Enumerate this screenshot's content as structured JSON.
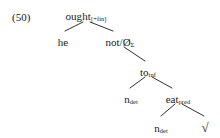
{
  "figure": {
    "example_number": "(50)",
    "background_color": "#ffffff",
    "ink_color": "#1a1a1a",
    "caption": "",
    "type": "dependency-tree"
  },
  "tree": {
    "nodes": [
      {
        "id": "ought",
        "base": "ought",
        "sub": "[+fin]",
        "x": 86,
        "y": 11,
        "role": "root"
      },
      {
        "id": "he",
        "base": "he",
        "sub": "",
        "x": 63,
        "y": 37,
        "role": "leaf"
      },
      {
        "id": "not",
        "base": "not/Ø",
        "sub": "Σ",
        "x": 120,
        "y": 37,
        "role": "branch"
      },
      {
        "id": "to",
        "base": "to",
        "sub": "inf",
        "x": 148,
        "y": 67,
        "role": "branch"
      },
      {
        "id": "n-det-upper",
        "base": "n",
        "sub": "det",
        "x": 131,
        "y": 94,
        "role": "leaf"
      },
      {
        "id": "eat",
        "base": "eat",
        "sub": "pred",
        "x": 178,
        "y": 94,
        "role": "branch"
      },
      {
        "id": "n-det-lower",
        "base": "n",
        "sub": "det",
        "x": 161,
        "y": 123,
        "role": "leaf"
      },
      {
        "id": "radical",
        "base": "√",
        "sub": "",
        "x": 205,
        "y": 121,
        "role": "leaf"
      }
    ],
    "edges": [
      {
        "id": "ought-he",
        "from": "ought",
        "to": "he",
        "x1": 83,
        "y1": 22,
        "x2": 65,
        "y2": 31
      },
      {
        "id": "ought-not",
        "from": "ought",
        "to": "not",
        "x1": 90,
        "y1": 22,
        "x2": 113,
        "y2": 31
      },
      {
        "id": "not-to",
        "from": "not",
        "to": "to",
        "x1": 124,
        "y1": 47,
        "x2": 145,
        "y2": 61
      },
      {
        "id": "to-ndet",
        "from": "to",
        "to": "n-det-upper",
        "x1": 145,
        "y1": 77,
        "x2": 130,
        "y2": 88
      },
      {
        "id": "to-eat",
        "from": "to",
        "to": "eat",
        "x1": 152,
        "y1": 77,
        "x2": 172,
        "y2": 88
      },
      {
        "id": "eat-ndet",
        "from": "eat",
        "to": "n-det-lower",
        "x1": 175,
        "y1": 104,
        "x2": 161,
        "y2": 116
      },
      {
        "id": "eat-radical",
        "from": "eat",
        "to": "radical",
        "x1": 182,
        "y1": 104,
        "x2": 204,
        "y2": 116
      }
    ]
  }
}
